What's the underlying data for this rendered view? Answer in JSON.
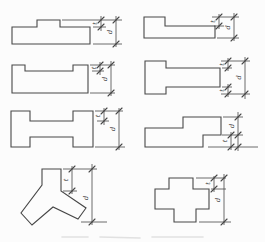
{
  "drawing": {
    "background": "#fcfcfc",
    "stroke_color": "#474747",
    "label_color": "#383838",
    "short_label": "t",
    "long_label": "d",
    "figures": [
      {
        "name": "rectangle-with-top-projection",
        "outline": [
          [
            12,
            27
          ],
          [
            37,
            27
          ],
          [
            37,
            20
          ],
          [
            60,
            20
          ],
          [
            60,
            27
          ],
          [
            90,
            27
          ],
          [
            90,
            44
          ],
          [
            12,
            44
          ]
        ],
        "ext_lines": [
          [
            62,
            20,
            122,
            20
          ],
          [
            93,
            27,
            106,
            27
          ],
          [
            93,
            44,
            122,
            44
          ]
        ],
        "dims": [
          {
            "x": 101,
            "y1": 16,
            "y2": 31,
            "ticks": [
              20,
              27
            ],
            "label": "t",
            "lx": 97,
            "ly": 23.5
          },
          {
            "x": 116,
            "y1": 16,
            "y2": 47,
            "ticks": [
              20,
              44
            ],
            "label": "d",
            "lx": 112,
            "ly": 32
          }
        ]
      },
      {
        "name": "rectangle-with-top-recess",
        "outline": [
          [
            12,
            65
          ],
          [
            25,
            65
          ],
          [
            25,
            71
          ],
          [
            73,
            71
          ],
          [
            73,
            65
          ],
          [
            88,
            65
          ],
          [
            88,
            93
          ],
          [
            12,
            93
          ]
        ],
        "ext_lines": [
          [
            90,
            65,
            115,
            65
          ],
          [
            92,
            71,
            104,
            71
          ],
          [
            90,
            93,
            115,
            93
          ]
        ],
        "dims": [
          {
            "x": 100,
            "y1": 62,
            "y2": 75,
            "ticks": [
              65,
              71
            ],
            "label": "t",
            "lx": 96,
            "ly": 68
          },
          {
            "x": 111,
            "y1": 61,
            "y2": 96,
            "ticks": [
              65,
              93
            ],
            "label": "d",
            "lx": 107,
            "ly": 79
          }
        ]
      },
      {
        "name": "h-shape-plan",
        "outline": [
          [
            11,
            111
          ],
          [
            30,
            111
          ],
          [
            30,
            121
          ],
          [
            73,
            121
          ],
          [
            73,
            111
          ],
          [
            93,
            111
          ],
          [
            93,
            147
          ],
          [
            73,
            147
          ],
          [
            73,
            137
          ],
          [
            30,
            137
          ],
          [
            30,
            147
          ],
          [
            11,
            147
          ]
        ],
        "ext_lines": [
          [
            95,
            111,
            123,
            111
          ],
          [
            97,
            121,
            109,
            121
          ],
          [
            95,
            147,
            125,
            147
          ]
        ],
        "dims": [
          {
            "x": 104,
            "y1": 108,
            "y2": 125,
            "ticks": [
              111,
              121
            ],
            "label": "t",
            "lx": 100,
            "ly": 116
          },
          {
            "x": 119,
            "y1": 108,
            "y2": 150,
            "ticks": [
              111,
              147
            ],
            "label": "d",
            "lx": 115,
            "ly": 129
          }
        ]
      },
      {
        "name": "l-shape-plan",
        "outline": [
          [
            144,
            17
          ],
          [
            165,
            17
          ],
          [
            165,
            26
          ],
          [
            215,
            26
          ],
          [
            215,
            38
          ],
          [
            144,
            38
          ]
        ],
        "ext_lines": [
          [
            212,
            17,
            239,
            17
          ],
          [
            214,
            26,
            224,
            26
          ],
          [
            217,
            38,
            239,
            38
          ]
        ],
        "dims": [
          {
            "x": 219,
            "y1": 14,
            "y2": 29,
            "ticks": [
              17,
              26
            ],
            "label": "t",
            "lx": 215,
            "ly": 21.5
          },
          {
            "x": 234,
            "y1": 13,
            "y2": 41,
            "ticks": [
              17,
              38
            ],
            "label": "d",
            "lx": 230,
            "ly": 27.5
          }
        ]
      },
      {
        "name": "t-shape-plan",
        "outline": [
          [
            145,
            61
          ],
          [
            166,
            61
          ],
          [
            166,
            68
          ],
          [
            220,
            68
          ],
          [
            220,
            87
          ],
          [
            166,
            87
          ],
          [
            166,
            94
          ],
          [
            145,
            94
          ]
        ],
        "ext_lines": [
          [
            221,
            61,
            250,
            61
          ],
          [
            222,
            68,
            232,
            68
          ],
          [
            222,
            87,
            232,
            87
          ],
          [
            221,
            94,
            250,
            94
          ]
        ],
        "dims": [
          {
            "x": 228,
            "y1": 58,
            "y2": 71,
            "ticks": [
              61,
              68
            ],
            "label": "t",
            "lx": 224,
            "ly": 64.5
          },
          {
            "x": 228,
            "y1": 84,
            "y2": 97,
            "ticks": [
              87,
              94
            ],
            "label": "t",
            "lx": 224,
            "ly": 90.5
          },
          {
            "x": 245,
            "y1": 57,
            "y2": 99,
            "ticks": [
              61,
              94
            ],
            "label": "d",
            "lx": 241,
            "ly": 77.5
          }
        ]
      },
      {
        "name": "stepped-z-shape-plan",
        "outline": [
          [
            145,
            128
          ],
          [
            183,
            128
          ],
          [
            183,
            117
          ],
          [
            221,
            117
          ],
          [
            221,
            135
          ],
          [
            203,
            135
          ],
          [
            203,
            147
          ],
          [
            145,
            147
          ]
        ],
        "ext_lines": [
          [
            223,
            117,
            243,
            117
          ],
          [
            222,
            135,
            243,
            135
          ],
          [
            208,
            147,
            258,
            147
          ]
        ],
        "dims": [
          {
            "x": 231,
            "y1": 132,
            "y2": 150,
            "ticks": [
              135,
              147
            ],
            "label": "t",
            "lx": 227,
            "ly": 141
          },
          {
            "x": 238,
            "y1": 112,
            "y2": 151,
            "ticks": [
              117,
              135,
              147
            ],
            "label": "d",
            "lx": 234,
            "ly": 126
          }
        ]
      },
      {
        "name": "y-shape-plan",
        "outline": [
          [
            42,
            169
          ],
          [
            61,
            169
          ],
          [
            61,
            191
          ],
          [
            86,
            208
          ],
          [
            78,
            219
          ],
          [
            53,
            207
          ],
          [
            32,
            225
          ],
          [
            21,
            213
          ],
          [
            42,
            185
          ]
        ],
        "ext_lines": [
          [
            63,
            169,
            97,
            169
          ],
          [
            63,
            191,
            77,
            191
          ],
          [
            81,
            222,
            107,
            222
          ]
        ],
        "dims": [
          {
            "x": 72,
            "y1": 166,
            "y2": 194,
            "ticks": [
              169,
              191
            ],
            "label": "t",
            "lx": 68,
            "ly": 180
          },
          {
            "x": 92,
            "y1": 164,
            "y2": 225,
            "ticks": [
              169,
              222
            ],
            "label": "d",
            "lx": 88,
            "ly": 198
          }
        ]
      },
      {
        "name": "cross-shape-plan",
        "outline": [
          [
            169,
            178
          ],
          [
            193,
            178
          ],
          [
            193,
            189
          ],
          [
            209,
            189
          ],
          [
            209,
            209
          ],
          [
            196,
            209
          ],
          [
            196,
            222
          ],
          [
            174,
            222
          ],
          [
            174,
            209
          ],
          [
            155,
            209
          ],
          [
            155,
            189
          ],
          [
            169,
            189
          ]
        ],
        "ext_lines": [
          [
            196,
            178,
            226,
            178
          ],
          [
            211,
            189,
            226,
            189
          ],
          [
            199,
            222,
            231,
            222
          ]
        ],
        "dims": [
          {
            "x": 214,
            "y1": 176,
            "y2": 192,
            "ticks": [
              178,
              189
            ],
            "label": "t",
            "lx": 210,
            "ly": 183.5
          },
          {
            "x": 224,
            "y1": 174,
            "y2": 225,
            "ticks": [
              178,
              222
            ],
            "label": "d",
            "lx": 220,
            "ly": 200
          }
        ]
      }
    ],
    "caption_remnant": {
      "color": "#cccccc",
      "dashes": [
        [
          62,
          237,
          88,
          237
        ],
        [
          100,
          237,
          140,
          238
        ],
        [
          152,
          237,
          203,
          237
        ]
      ]
    }
  }
}
